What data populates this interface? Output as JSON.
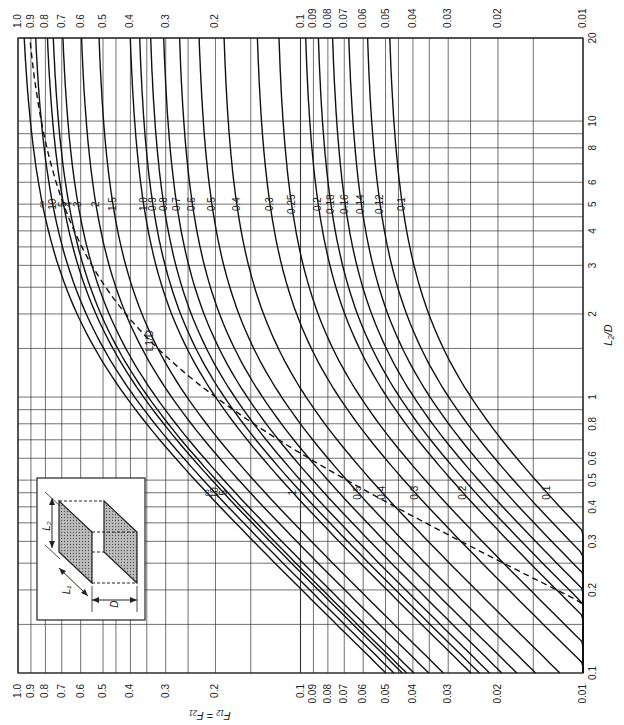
{
  "chart_data": {
    "type": "line",
    "title": "",
    "xlabel": "L2/D",
    "ylabel": "F12 = F21",
    "x_scale": "log",
    "y_scale": "log",
    "xlim": [
      0.1,
      20
    ],
    "ylim": [
      0.01,
      1.0
    ],
    "x_ticks": [
      "0.1",
      "0.2",
      "0.3",
      "0.4",
      "0.5",
      "0.6",
      "0.8",
      "1",
      "2",
      "3",
      "4",
      "5",
      "6",
      "8",
      "10",
      "20"
    ],
    "x_tick_values": [
      0.1,
      0.2,
      0.3,
      0.4,
      0.5,
      0.6,
      0.8,
      1,
      2,
      3,
      4,
      5,
      6,
      8,
      10,
      20
    ],
    "y_ticks": [
      "1.0",
      "0.9",
      "0.8",
      "0.7",
      "0.6",
      "0.5",
      "0.4",
      "0.3",
      "0.2",
      "0.1",
      "0.09",
      "0.08",
      "0.07",
      "0.06",
      "0.05",
      "0.04",
      "0.03",
      "0.02",
      "0.01"
    ],
    "y_tick_values": [
      1.0,
      0.9,
      0.8,
      0.7,
      0.6,
      0.5,
      0.4,
      0.3,
      0.2,
      0.1,
      0.09,
      0.08,
      0.07,
      0.06,
      0.05,
      0.04,
      0.03,
      0.02,
      0.01
    ],
    "grid": true,
    "parameter_name": "L1/D",
    "series": [
      {
        "name": "∞",
        "L1D": 1000,
        "style": "solid",
        "label_upper": "∞",
        "label_lower": "∞"
      },
      {
        "name": "10",
        "L1D": 10,
        "style": "solid",
        "label_upper": "10",
        "label_lower": "10"
      },
      {
        "name": "5",
        "L1D": 5,
        "style": "solid",
        "label_upper": "5",
        "label_lower": "5"
      },
      {
        "name": "4",
        "L1D": 4,
        "style": "solid",
        "label_upper": "4",
        "label_lower": ""
      },
      {
        "name": "3",
        "L1D": 3,
        "style": "solid",
        "label_upper": "3",
        "label_lower": ""
      },
      {
        "name": "2",
        "L1D": 2,
        "style": "solid",
        "label_upper": "2",
        "label_lower": ""
      },
      {
        "name": "1.5",
        "L1D": 1.5,
        "style": "solid",
        "label_upper": "1.5",
        "label_lower": ""
      },
      {
        "name": "1.0",
        "L1D": 1.0,
        "style": "solid",
        "label_upper": "1.0",
        "label_lower": "1"
      },
      {
        "name": "0.9",
        "L1D": 0.9,
        "style": "solid",
        "label_upper": "0.9",
        "label_lower": ""
      },
      {
        "name": "0.8",
        "L1D": 0.8,
        "style": "solid",
        "label_upper": "0.8",
        "label_lower": ""
      },
      {
        "name": "0.7",
        "L1D": 0.7,
        "style": "solid",
        "label_upper": "0.7",
        "label_lower": ""
      },
      {
        "name": "0.6",
        "L1D": 0.6,
        "style": "solid",
        "label_upper": "0.6",
        "label_lower": ""
      },
      {
        "name": "0.5",
        "L1D": 0.5,
        "style": "solid",
        "label_upper": "0.5",
        "label_lower": "0.5"
      },
      {
        "name": "0.4",
        "L1D": 0.4,
        "style": "solid",
        "label_upper": "0.4",
        "label_lower": "0.4"
      },
      {
        "name": "0.3",
        "L1D": 0.3,
        "style": "solid",
        "label_upper": "0.3",
        "label_lower": "0.3"
      },
      {
        "name": "0.25",
        "L1D": 0.25,
        "style": "solid",
        "label_upper": "0.25",
        "label_lower": ""
      },
      {
        "name": "0.2",
        "L1D": 0.2,
        "style": "solid",
        "label_upper": "0.2",
        "label_lower": "0.2"
      },
      {
        "name": "0.18",
        "L1D": 0.18,
        "style": "solid",
        "label_upper": "0.18",
        "label_lower": ""
      },
      {
        "name": "0.16",
        "L1D": 0.16,
        "style": "solid",
        "label_upper": "0.16",
        "label_lower": ""
      },
      {
        "name": "0.14",
        "L1D": 0.14,
        "style": "solid",
        "label_upper": "0.14",
        "label_lower": ""
      },
      {
        "name": "0.12",
        "L1D": 0.12,
        "style": "solid",
        "label_upper": "0.12",
        "label_lower": ""
      },
      {
        "name": "0.1",
        "L1D": 0.1,
        "style": "solid",
        "label_upper": "0.1",
        "label_lower": "0.1"
      },
      {
        "name": "L1/D (envelope)",
        "L1D": "L2",
        "style": "dashed",
        "label_upper": "L1/D",
        "label_lower": ""
      }
    ],
    "annotations": [
      "L1/D",
      "Inset: two parallel shaded rectangles with dimensions L1, L2 and separation D"
    ]
  },
  "inset": {
    "labels": {
      "L1": "L₁",
      "L2": "L₂",
      "D": "D"
    }
  },
  "axis_titles": {
    "x": "L₂/D",
    "y": "F₁₂ = F₂₁"
  }
}
